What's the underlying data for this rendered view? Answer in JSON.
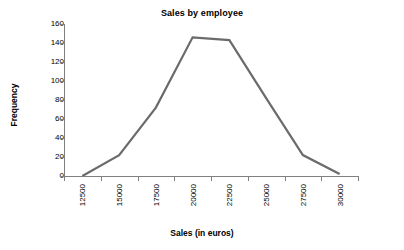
{
  "chart_data": {
    "type": "line",
    "title": "Sales by employee",
    "xlabel": "Sales (in euros)",
    "ylabel": "Frequency",
    "x": [
      12500,
      15000,
      17500,
      20000,
      22500,
      25000,
      27500,
      30000
    ],
    "categories": [
      "12500",
      "15000",
      "17500",
      "20000",
      "22500",
      "25000",
      "27500",
      "30000"
    ],
    "values": [
      0,
      22,
      72,
      146,
      143,
      82,
      22,
      2
    ],
    "series": [
      {
        "name": "Frequency",
        "values": [
          0,
          22,
          72,
          146,
          143,
          82,
          22,
          2
        ]
      }
    ],
    "xlim": [
      12500,
      30000
    ],
    "ylim": [
      0,
      160
    ],
    "ytick_labels": [
      "0",
      "20",
      "40",
      "60",
      "80",
      "100",
      "120",
      "140",
      "160"
    ],
    "ytick_values": [
      0,
      20,
      40,
      60,
      80,
      100,
      120,
      140,
      160
    ],
    "grid": false,
    "legend": "none",
    "line_color": "#6b6b6b",
    "axis_color": "#808080",
    "text_color": "#000000",
    "background": "#ffffff"
  }
}
